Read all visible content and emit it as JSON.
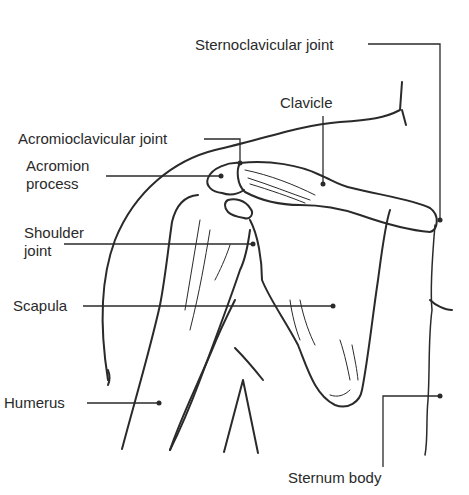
{
  "diagram": {
    "type": "anatomical-illustration",
    "labels": [
      {
        "id": "sternoclavicular",
        "text": "Sternoclavicular joint"
      },
      {
        "id": "clavicle",
        "text": "Clavicle"
      },
      {
        "id": "acromioclavicular",
        "text": "Acromioclavicular joint"
      },
      {
        "id": "acromion_line1",
        "text": "Acromion"
      },
      {
        "id": "acromion_line2",
        "text": "process"
      },
      {
        "id": "shoulder_line1",
        "text": "Shoulder"
      },
      {
        "id": "shoulder_line2",
        "text": "joint"
      },
      {
        "id": "scapula",
        "text": "Scapula"
      },
      {
        "id": "humerus",
        "text": "Humerus"
      },
      {
        "id": "sternum",
        "text": "Sternum body"
      }
    ],
    "colors": {
      "ink": "#2a2a2a",
      "background": "#ffffff"
    }
  }
}
